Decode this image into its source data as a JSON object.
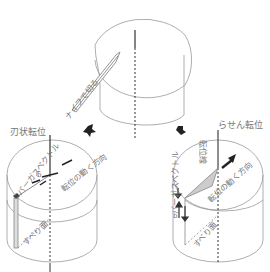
{
  "top_cylinder": {
    "knife_label": "ナイフで切る"
  },
  "left_cylinder": {
    "title": "刃状転位",
    "burgers_label": "バーガスベクトル",
    "burgers_symbol": "b",
    "motion_label": "転位の動く方向",
    "slip_label": "すべり面"
  },
  "right_cylinder": {
    "title": "らせん転位",
    "dislocation_line_label": "転位線",
    "burgers_label": "バーガスベクトル",
    "burgers_symbol": "b",
    "motion_label": "転位の動く方向",
    "slip_label": "すべり面"
  },
  "colors": {
    "line": "#888888",
    "dark": "#222222",
    "shade": "#cccccc"
  }
}
